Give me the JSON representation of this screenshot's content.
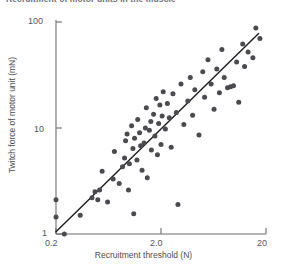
{
  "caption": {
    "text": "Recruitment of motor units in the muscle"
  },
  "chart_data": {
    "type": "scatter",
    "title": "",
    "xlabel": "Recruitment threshold (N)",
    "ylabel": "Twitch force of motor unit (mN)",
    "xscale": "log",
    "yscale": "log",
    "xlim": [
      0.2,
      20
    ],
    "ylim": [
      1,
      100
    ],
    "xticks": [
      0.2,
      2.0,
      20
    ],
    "xticklabels": [
      "0.2",
      "2.0",
      "20"
    ],
    "yticks": [
      1,
      10,
      100
    ],
    "yticklabels": [
      "1",
      "10",
      "100"
    ],
    "grid": false,
    "legend": null,
    "marker": {
      "shape": "circle",
      "size_px": 5,
      "color": "#4a4a4f"
    },
    "trendline": {
      "label": "regression line",
      "color": "#1d1d1f",
      "width_px": 1.4,
      "x": [
        0.2,
        17.0
      ],
      "y": [
        1.05,
        78.0
      ]
    },
    "points": [
      {
        "x": 0.2,
        "y": 2.1
      },
      {
        "x": 0.2,
        "y": 1.45
      },
      {
        "x": 0.24,
        "y": 1.0
      },
      {
        "x": 0.34,
        "y": 1.5
      },
      {
        "x": 0.44,
        "y": 2.2
      },
      {
        "x": 0.47,
        "y": 2.5
      },
      {
        "x": 0.5,
        "y": 2.1
      },
      {
        "x": 0.52,
        "y": 2.6
      },
      {
        "x": 0.55,
        "y": 3.9
      },
      {
        "x": 0.62,
        "y": 2.0
      },
      {
        "x": 0.7,
        "y": 3.3
      },
      {
        "x": 0.72,
        "y": 6.0
      },
      {
        "x": 0.8,
        "y": 3.0
      },
      {
        "x": 0.86,
        "y": 4.3
      },
      {
        "x": 0.9,
        "y": 5.2
      },
      {
        "x": 0.92,
        "y": 7.6
      },
      {
        "x": 0.95,
        "y": 8.8
      },
      {
        "x": 0.98,
        "y": 2.6
      },
      {
        "x": 1.0,
        "y": 4.6
      },
      {
        "x": 1.05,
        "y": 10.5
      },
      {
        "x": 1.08,
        "y": 6.4
      },
      {
        "x": 1.1,
        "y": 1.55
      },
      {
        "x": 1.12,
        "y": 8.0
      },
      {
        "x": 1.18,
        "y": 5.0
      },
      {
        "x": 1.2,
        "y": 12.0
      },
      {
        "x": 1.25,
        "y": 9.0
      },
      {
        "x": 1.28,
        "y": 6.8
      },
      {
        "x": 1.32,
        "y": 4.0
      },
      {
        "x": 1.38,
        "y": 7.2
      },
      {
        "x": 1.42,
        "y": 10.0
      },
      {
        "x": 1.45,
        "y": 15.5
      },
      {
        "x": 1.48,
        "y": 3.4
      },
      {
        "x": 1.55,
        "y": 9.5
      },
      {
        "x": 1.6,
        "y": 11.5
      },
      {
        "x": 1.62,
        "y": 6.2
      },
      {
        "x": 1.7,
        "y": 13.5
      },
      {
        "x": 1.75,
        "y": 8.4
      },
      {
        "x": 1.8,
        "y": 19.0
      },
      {
        "x": 1.85,
        "y": 5.6
      },
      {
        "x": 1.9,
        "y": 11.0
      },
      {
        "x": 1.95,
        "y": 16.5
      },
      {
        "x": 2.0,
        "y": 7.0
      },
      {
        "x": 2.05,
        "y": 13.0
      },
      {
        "x": 2.1,
        "y": 22.0
      },
      {
        "x": 2.2,
        "y": 9.8
      },
      {
        "x": 2.3,
        "y": 17.0
      },
      {
        "x": 2.4,
        "y": 12.5
      },
      {
        "x": 2.5,
        "y": 6.6
      },
      {
        "x": 2.6,
        "y": 21.0
      },
      {
        "x": 2.8,
        "y": 14.0
      },
      {
        "x": 2.9,
        "y": 1.9
      },
      {
        "x": 3.1,
        "y": 26.0
      },
      {
        "x": 3.3,
        "y": 10.8
      },
      {
        "x": 3.6,
        "y": 18.0
      },
      {
        "x": 3.8,
        "y": 30.0
      },
      {
        "x": 4.0,
        "y": 13.2
      },
      {
        "x": 4.2,
        "y": 23.0
      },
      {
        "x": 4.6,
        "y": 8.6
      },
      {
        "x": 5.0,
        "y": 34.0
      },
      {
        "x": 5.2,
        "y": 19.5
      },
      {
        "x": 5.6,
        "y": 44.0
      },
      {
        "x": 6.0,
        "y": 26.0
      },
      {
        "x": 6.4,
        "y": 15.0
      },
      {
        "x": 6.8,
        "y": 36.0
      },
      {
        "x": 7.2,
        "y": 21.5
      },
      {
        "x": 7.6,
        "y": 55.0
      },
      {
        "x": 8.0,
        "y": 30.0
      },
      {
        "x": 8.6,
        "y": 24.0
      },
      {
        "x": 9.2,
        "y": 24.5
      },
      {
        "x": 9.8,
        "y": 25.0
      },
      {
        "x": 10.5,
        "y": 42.0
      },
      {
        "x": 11.0,
        "y": 17.5
      },
      {
        "x": 12.0,
        "y": 62.0
      },
      {
        "x": 12.5,
        "y": 38.0
      },
      {
        "x": 13.5,
        "y": 52.0
      },
      {
        "x": 15.0,
        "y": 46.0
      },
      {
        "x": 16.0,
        "y": 88.0
      },
      {
        "x": 17.5,
        "y": 70.0
      }
    ]
  }
}
